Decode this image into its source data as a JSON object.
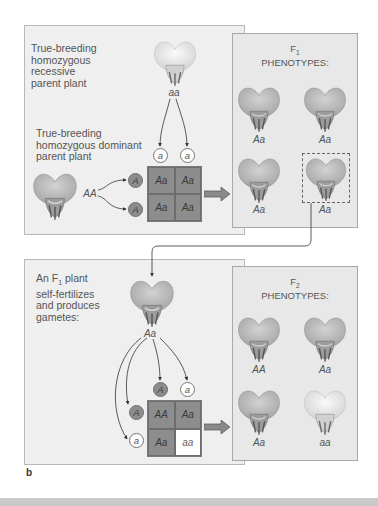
{
  "top": {
    "recessive_parent_label": "True-breeding homozygous recessive parent plant",
    "recessive_parent_lines": [
      "True-breeding",
      "homozygous",
      "recessive",
      "parent plant"
    ],
    "recessive_parent_genotype": "aa",
    "dominant_parent_lines": [
      "True-breeding",
      "homozygous dominant",
      "parent plant"
    ],
    "dominant_parent_genotype": "AA",
    "top_gametes": [
      "a",
      "a"
    ],
    "side_gametes": [
      "A",
      "A"
    ],
    "punnett": [
      "Aa",
      "Aa",
      "Aa",
      "Aa"
    ],
    "f1_title_main": "F",
    "f1_title_sub": "1",
    "f1_title_line2": "PHENOTYPES:",
    "f1_genotypes": [
      "Aa",
      "Aa",
      "Aa",
      "Aa"
    ]
  },
  "bottom": {
    "f1_plant_lines": [
      "An F",
      "1",
      " plant",
      "self-fertilizes",
      "and produces",
      "gametes:"
    ],
    "f1_plant_genotype": "Aa",
    "top_gametes": [
      "A",
      "a"
    ],
    "side_gametes": [
      "A",
      "a"
    ],
    "punnett": [
      "AA",
      "Aa",
      "Aa",
      "aa"
    ],
    "f2_title_main": "F",
    "f2_title_sub": "2",
    "f2_title_line2": "PHENOTYPES:",
    "f2_genotypes": [
      "AA",
      "Aa",
      "Aa",
      "aa"
    ]
  },
  "figure_label": "b",
  "colors": {
    "dominant_gray": "#8d8d8d",
    "recessive_white": "#ffffff",
    "panel_bg": "#efefef",
    "flower_dominant": "#b8b8b8",
    "flower_recessive": "#e6e6e6"
  }
}
